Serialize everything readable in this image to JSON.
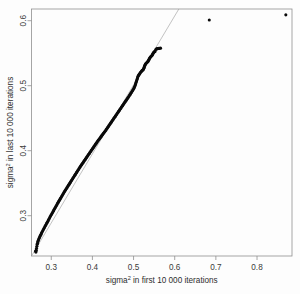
{
  "chart_data": {
    "type": "scatter",
    "title": "",
    "subtitle": "",
    "xlabel": "sigma2 in first 10 000 iterations",
    "ylabel": "sigma2 in last 10 000 iterations",
    "xlabel_base": "sigma",
    "xlabel_sup": "2",
    "xlabel_rest": " in first 10 000 iterations",
    "ylabel_base": "sigma",
    "ylabel_sup": "2",
    "ylabel_rest": " in last 10 000 iterations",
    "xlim": [
      0.252,
      0.885
    ],
    "ylim": [
      0.238,
      0.618
    ],
    "xticks": [
      0.3,
      0.4,
      0.5,
      0.6,
      0.7,
      0.8
    ],
    "xtick_labels": [
      "0.3",
      "0.4",
      "0.5",
      "0.6",
      "0.7",
      "0.8"
    ],
    "yticks": [
      0.3,
      0.4,
      0.5,
      0.6
    ],
    "ytick_labels": [
      "0.3",
      "0.4",
      "0.5",
      "0.6"
    ],
    "grid": false,
    "legend": false,
    "legend_position": "none",
    "point_color": "#0a0a0a",
    "point_size": 2.0,
    "frame_color": "#8f8f8f",
    "reference_line": {
      "name": "identity-line",
      "color": "#9a9a9a",
      "width": 0.6,
      "x": [
        0.2525,
        0.6105
      ],
      "y": [
        0.2385,
        0.6185
      ]
    },
    "series": [
      {
        "name": "sigma2 first vs last",
        "color": "#0a0a0a",
        "points": [
          [
            0.262,
            0.2455
          ],
          [
            0.2628,
            0.244
          ],
          [
            0.2635,
            0.247
          ],
          [
            0.2642,
            0.25
          ],
          [
            0.265,
            0.253
          ],
          [
            0.2658,
            0.256
          ],
          [
            0.2665,
            0.2575
          ],
          [
            0.2672,
            0.2598
          ],
          [
            0.268,
            0.2612
          ],
          [
            0.269,
            0.2628
          ],
          [
            0.27,
            0.2645
          ],
          [
            0.2712,
            0.2662
          ],
          [
            0.2725,
            0.268
          ],
          [
            0.2738,
            0.2698
          ],
          [
            0.275,
            0.2715
          ],
          [
            0.2763,
            0.2732
          ],
          [
            0.2776,
            0.2748
          ],
          [
            0.279,
            0.2765
          ],
          [
            0.2804,
            0.2782
          ],
          [
            0.2818,
            0.2798
          ],
          [
            0.2832,
            0.2815
          ],
          [
            0.2846,
            0.2832
          ],
          [
            0.286,
            0.2848
          ],
          [
            0.2874,
            0.2865
          ],
          [
            0.2888,
            0.2882
          ],
          [
            0.2902,
            0.2898
          ],
          [
            0.2916,
            0.2915
          ],
          [
            0.293,
            0.2932
          ],
          [
            0.2944,
            0.2948
          ],
          [
            0.2958,
            0.2965
          ],
          [
            0.2972,
            0.2982
          ],
          [
            0.2986,
            0.2998
          ],
          [
            0.3,
            0.3014
          ],
          [
            0.3014,
            0.303
          ],
          [
            0.3028,
            0.3046
          ],
          [
            0.3042,
            0.3062
          ],
          [
            0.3056,
            0.3078
          ],
          [
            0.307,
            0.3094
          ],
          [
            0.3084,
            0.311
          ],
          [
            0.3098,
            0.3126
          ],
          [
            0.3112,
            0.3142
          ],
          [
            0.3126,
            0.3158
          ],
          [
            0.314,
            0.3174
          ],
          [
            0.3154,
            0.319
          ],
          [
            0.3168,
            0.3206
          ],
          [
            0.3182,
            0.3221
          ],
          [
            0.3196,
            0.3236
          ],
          [
            0.321,
            0.3251
          ],
          [
            0.3224,
            0.3266
          ],
          [
            0.3238,
            0.3281
          ],
          [
            0.3252,
            0.3296
          ],
          [
            0.3266,
            0.3311
          ],
          [
            0.328,
            0.3326
          ],
          [
            0.3294,
            0.3341
          ],
          [
            0.3308,
            0.3356
          ],
          [
            0.3322,
            0.3371
          ],
          [
            0.3336,
            0.3386
          ],
          [
            0.335,
            0.34
          ],
          [
            0.3364,
            0.3414
          ],
          [
            0.3378,
            0.3428
          ],
          [
            0.3392,
            0.3442
          ],
          [
            0.3406,
            0.3456
          ],
          [
            0.342,
            0.347
          ],
          [
            0.3434,
            0.3484
          ],
          [
            0.3448,
            0.3498
          ],
          [
            0.3462,
            0.3512
          ],
          [
            0.3476,
            0.3526
          ],
          [
            0.349,
            0.354
          ],
          [
            0.3504,
            0.3554
          ],
          [
            0.3518,
            0.3568
          ],
          [
            0.3532,
            0.3582
          ],
          [
            0.3546,
            0.3596
          ],
          [
            0.356,
            0.361
          ],
          [
            0.3574,
            0.3624
          ],
          [
            0.3588,
            0.3638
          ],
          [
            0.3602,
            0.3652
          ],
          [
            0.3616,
            0.3666
          ],
          [
            0.363,
            0.368
          ],
          [
            0.3644,
            0.3694
          ],
          [
            0.3658,
            0.3708
          ],
          [
            0.3672,
            0.3722
          ],
          [
            0.3686,
            0.3736
          ],
          [
            0.37,
            0.375
          ],
          [
            0.3714,
            0.3763
          ],
          [
            0.3728,
            0.3776
          ],
          [
            0.3742,
            0.3789
          ],
          [
            0.3756,
            0.3802
          ],
          [
            0.377,
            0.3815
          ],
          [
            0.3784,
            0.3828
          ],
          [
            0.3798,
            0.3841
          ],
          [
            0.3812,
            0.3854
          ],
          [
            0.3826,
            0.3867
          ],
          [
            0.384,
            0.388
          ],
          [
            0.3854,
            0.3893
          ],
          [
            0.3868,
            0.3906
          ],
          [
            0.3882,
            0.3919
          ],
          [
            0.3896,
            0.3932
          ],
          [
            0.391,
            0.3945
          ],
          [
            0.3924,
            0.3958
          ],
          [
            0.3938,
            0.3971
          ],
          [
            0.3952,
            0.3984
          ],
          [
            0.3966,
            0.3997
          ],
          [
            0.398,
            0.401
          ],
          [
            0.3994,
            0.4023
          ],
          [
            0.4008,
            0.4036
          ],
          [
            0.4022,
            0.4049
          ],
          [
            0.4036,
            0.4062
          ],
          [
            0.405,
            0.4075
          ],
          [
            0.4064,
            0.4088
          ],
          [
            0.4078,
            0.4101
          ],
          [
            0.4092,
            0.4114
          ],
          [
            0.4106,
            0.4127
          ],
          [
            0.412,
            0.414
          ],
          [
            0.4134,
            0.4152
          ],
          [
            0.4148,
            0.4164
          ],
          [
            0.4162,
            0.4176
          ],
          [
            0.4176,
            0.4188
          ],
          [
            0.419,
            0.42
          ],
          [
            0.4204,
            0.4212
          ],
          [
            0.4218,
            0.4224
          ],
          [
            0.4232,
            0.4236
          ],
          [
            0.4246,
            0.4248
          ],
          [
            0.426,
            0.426
          ],
          [
            0.4274,
            0.4272
          ],
          [
            0.4288,
            0.4284
          ],
          [
            0.4302,
            0.4296
          ],
          [
            0.4316,
            0.4308
          ],
          [
            0.433,
            0.432
          ],
          [
            0.4344,
            0.4333
          ],
          [
            0.4358,
            0.4346
          ],
          [
            0.4372,
            0.4359
          ],
          [
            0.4386,
            0.4372
          ],
          [
            0.44,
            0.4385
          ],
          [
            0.4414,
            0.4398
          ],
          [
            0.4428,
            0.4411
          ],
          [
            0.4442,
            0.4424
          ],
          [
            0.4456,
            0.4437
          ],
          [
            0.447,
            0.445
          ],
          [
            0.4484,
            0.4463
          ],
          [
            0.4498,
            0.4476
          ],
          [
            0.4512,
            0.4489
          ],
          [
            0.4526,
            0.4502
          ],
          [
            0.454,
            0.4515
          ],
          [
            0.4554,
            0.4528
          ],
          [
            0.4568,
            0.4541
          ],
          [
            0.4582,
            0.4554
          ],
          [
            0.4596,
            0.4567
          ],
          [
            0.461,
            0.458
          ],
          [
            0.4624,
            0.4593
          ],
          [
            0.4638,
            0.4606
          ],
          [
            0.4652,
            0.4619
          ],
          [
            0.4666,
            0.4632
          ],
          [
            0.468,
            0.4645
          ],
          [
            0.4694,
            0.4658
          ],
          [
            0.4708,
            0.4671
          ],
          [
            0.4722,
            0.4684
          ],
          [
            0.4736,
            0.4697
          ],
          [
            0.475,
            0.471
          ],
          [
            0.4764,
            0.4723
          ],
          [
            0.4778,
            0.4736
          ],
          [
            0.4792,
            0.4749
          ],
          [
            0.4806,
            0.4762
          ],
          [
            0.482,
            0.4775
          ],
          [
            0.4834,
            0.4788
          ],
          [
            0.4848,
            0.4801
          ],
          [
            0.4862,
            0.4814
          ],
          [
            0.4876,
            0.4827
          ],
          [
            0.489,
            0.484
          ],
          [
            0.4904,
            0.4854
          ],
          [
            0.4918,
            0.4868
          ],
          [
            0.4932,
            0.4882
          ],
          [
            0.4946,
            0.4896
          ],
          [
            0.496,
            0.491
          ],
          [
            0.4974,
            0.4924
          ],
          [
            0.4988,
            0.4938
          ],
          [
            0.5002,
            0.4952
          ],
          [
            0.5012,
            0.4966
          ],
          [
            0.5022,
            0.498
          ],
          [
            0.5032,
            0.4996
          ],
          [
            0.5042,
            0.5012
          ],
          [
            0.505,
            0.5028
          ],
          [
            0.5058,
            0.5044
          ],
          [
            0.5066,
            0.506
          ],
          [
            0.5074,
            0.5076
          ],
          [
            0.5082,
            0.5092
          ],
          [
            0.509,
            0.5108
          ],
          [
            0.5098,
            0.5124
          ],
          [
            0.5106,
            0.514
          ],
          [
            0.5116,
            0.5152
          ],
          [
            0.5126,
            0.5163
          ],
          [
            0.5136,
            0.5174
          ],
          [
            0.5148,
            0.5185
          ],
          [
            0.516,
            0.5196
          ],
          [
            0.5172,
            0.5207
          ],
          [
            0.5186,
            0.5218
          ],
          [
            0.52,
            0.5228
          ],
          [
            0.5214,
            0.5236
          ],
          [
            0.5228,
            0.5243
          ],
          [
            0.524,
            0.5252
          ],
          [
            0.525,
            0.5268
          ],
          [
            0.5258,
            0.5284
          ],
          [
            0.5266,
            0.53
          ],
          [
            0.5274,
            0.5314
          ],
          [
            0.5284,
            0.5326
          ],
          [
            0.5294,
            0.5336
          ],
          [
            0.5306,
            0.5344
          ],
          [
            0.5318,
            0.5352
          ],
          [
            0.533,
            0.536
          ],
          [
            0.5342,
            0.5368
          ],
          [
            0.5354,
            0.5378
          ],
          [
            0.5364,
            0.539
          ],
          [
            0.5374,
            0.5402
          ],
          [
            0.5384,
            0.5414
          ],
          [
            0.5394,
            0.5426
          ],
          [
            0.5404,
            0.5436
          ],
          [
            0.5416,
            0.5444
          ],
          [
            0.5428,
            0.5452
          ],
          [
            0.544,
            0.546
          ],
          [
            0.5452,
            0.547
          ],
          [
            0.5462,
            0.5482
          ],
          [
            0.5472,
            0.5494
          ],
          [
            0.5482,
            0.5506
          ],
          [
            0.5494,
            0.5516
          ],
          [
            0.5508,
            0.5522
          ],
          [
            0.5522,
            0.5528
          ],
          [
            0.554,
            0.5556
          ],
          [
            0.5558,
            0.5566
          ],
          [
            0.5576,
            0.557
          ],
          [
            0.5594,
            0.5572
          ],
          [
            0.5612,
            0.5574
          ],
          [
            0.563,
            0.5576
          ],
          [
            0.5656,
            0.5578
          ],
          [
            0.684,
            0.601
          ],
          [
            0.87,
            0.609
          ]
        ]
      }
    ],
    "outliers": [
      {
        "name": "outlier-1",
        "x": 0.684,
        "y": 0.601
      },
      {
        "name": "outlier-2",
        "x": 0.87,
        "y": 0.609
      }
    ]
  }
}
